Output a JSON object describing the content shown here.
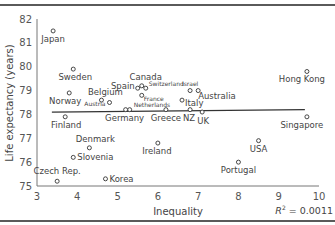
{
  "chart_data": {
    "type": "scatter",
    "title": "",
    "xlabel": "Inequality",
    "ylabel": "Life expectancy (years)",
    "xlim": [
      3,
      10
    ],
    "ylim": [
      75,
      82
    ],
    "xticks": [
      3,
      4,
      5,
      6,
      7,
      8,
      9,
      10
    ],
    "yticks": [
      75,
      76,
      77,
      78,
      79,
      80,
      81,
      82
    ],
    "grid": false,
    "annotation": "R² = 0.0011",
    "r_squared": 0.0011,
    "trendline": {
      "x": [
        3.37,
        9.65
      ],
      "y": [
        78.1,
        78.2
      ]
    },
    "points": [
      {
        "label": "Japan",
        "x": 3.4,
        "y": 81.5
      },
      {
        "label": "Sweden",
        "x": 3.9,
        "y": 79.9
      },
      {
        "label": "Norway",
        "x": 3.8,
        "y": 78.9
      },
      {
        "label": "Finland",
        "x": 3.7,
        "y": 77.9
      },
      {
        "label": "Belgium",
        "x": 4.6,
        "y": 78.6
      },
      {
        "label": "Austria",
        "x": 4.8,
        "y": 78.5
      },
      {
        "label": "Denmark",
        "x": 4.3,
        "y": 76.6
      },
      {
        "label": "Slovenia",
        "x": 3.9,
        "y": 76.2
      },
      {
        "label": "Czech Rep.",
        "x": 3.5,
        "y": 75.2
      },
      {
        "label": "Korea",
        "x": 4.7,
        "y": 75.3
      },
      {
        "label": "Spain",
        "x": 5.5,
        "y": 79.1
      },
      {
        "label": "Canada",
        "x": 5.6,
        "y": 79.2
      },
      {
        "label": "Switzerland",
        "x": 5.7,
        "y": 79.1
      },
      {
        "label": "France",
        "x": 5.6,
        "y": 78.8
      },
      {
        "label": "Netherlands",
        "x": 5.3,
        "y": 78.2
      },
      {
        "label": "Germany",
        "x": 5.2,
        "y": 78.2
      },
      {
        "label": "Greece",
        "x": 6.2,
        "y": 78.2
      },
      {
        "label": "NZ",
        "x": 6.8,
        "y": 78.2
      },
      {
        "label": "Israel",
        "x": 6.8,
        "y": 79.0
      },
      {
        "label": "Australia",
        "x": 7.0,
        "y": 79.0
      },
      {
        "label": "Italy",
        "x": 6.6,
        "y": 78.6
      },
      {
        "label": "UK",
        "x": 7.1,
        "y": 78.1
      },
      {
        "label": "Ireland",
        "x": 6.0,
        "y": 76.8
      },
      {
        "label": "USA",
        "x": 8.5,
        "y": 76.9
      },
      {
        "label": "Portugal",
        "x": 8.0,
        "y": 76.0
      },
      {
        "label": "Hong Kong",
        "x": 9.7,
        "y": 79.8
      },
      {
        "label": "Singapore",
        "x": 9.7,
        "y": 77.9
      }
    ]
  },
  "axes": {
    "xlabel": "Inequality",
    "ylabel": "Life expectancy (years)",
    "r2_label": "R",
    "r2_sup": "2",
    "r2_value": " = 0.0011"
  }
}
